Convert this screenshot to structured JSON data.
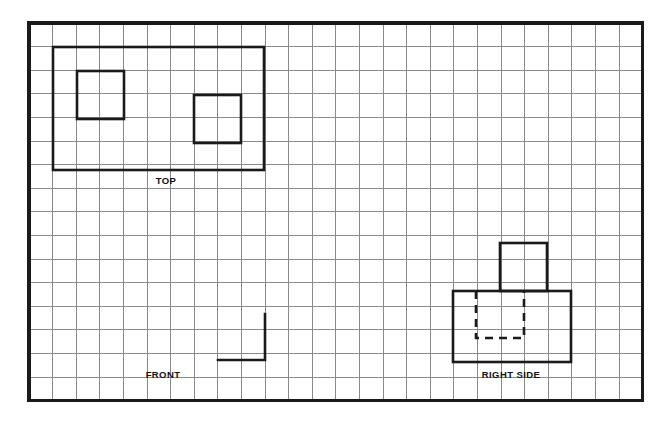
{
  "drawing": {
    "title": "Orthographic Projection Worksheet",
    "background_color": "#ffffff",
    "grid": {
      "columns": 26,
      "rows": 16,
      "cell_size_px": 23.6,
      "origin_x": 29,
      "origin_y": 23,
      "width_px": 613.6,
      "height_px": 377.6,
      "line_color": "#8a8a8a",
      "border_color": "#1a1a1a",
      "border_width_px": 3.2
    },
    "object_line_color": "#1a1a1a",
    "object_line_width_px": 2.6,
    "hidden_line_dash": "8 6"
  },
  "views": [
    {
      "name": "top-view",
      "label": "TOP",
      "label_x": 166,
      "label_y": 184,
      "shapes": [
        {
          "name": "top-outer-rectangle",
          "type": "rect",
          "style": "visible",
          "x": 53,
          "y": 47,
          "width": 211,
          "height": 123
        },
        {
          "name": "top-left-inner-square",
          "type": "rect",
          "style": "visible",
          "x": 77,
          "y": 71,
          "width": 47,
          "height": 48
        },
        {
          "name": "top-right-inner-square",
          "type": "rect",
          "style": "visible",
          "x": 194,
          "y": 95,
          "width": 47,
          "height": 48
        }
      ]
    },
    {
      "name": "front-view",
      "label": "FRONT",
      "label_x": 163,
      "label_y": 378,
      "shapes": [
        {
          "name": "front-partial-corner-line",
          "type": "polyline",
          "style": "visible",
          "points": "218,360 265,360 265,314"
        }
      ]
    },
    {
      "name": "right-side-view",
      "label": "RIGHT SIDE",
      "label_x": 511,
      "label_y": 378,
      "shapes": [
        {
          "name": "right-side-base-rectangle",
          "type": "rect",
          "style": "visible",
          "x": 453,
          "y": 291,
          "width": 118,
          "height": 71
        },
        {
          "name": "right-side-upper-rectangle",
          "type": "rect",
          "style": "visible",
          "x": 500,
          "y": 243,
          "width": 47,
          "height": 48
        },
        {
          "name": "right-side-hidden-channel",
          "type": "polyline",
          "style": "hidden",
          "points": "476,291 476,338 524,338 524,291"
        }
      ]
    }
  ],
  "labels": {
    "top": "TOP",
    "front": "FRONT",
    "right_side": "RIGHT SIDE"
  }
}
